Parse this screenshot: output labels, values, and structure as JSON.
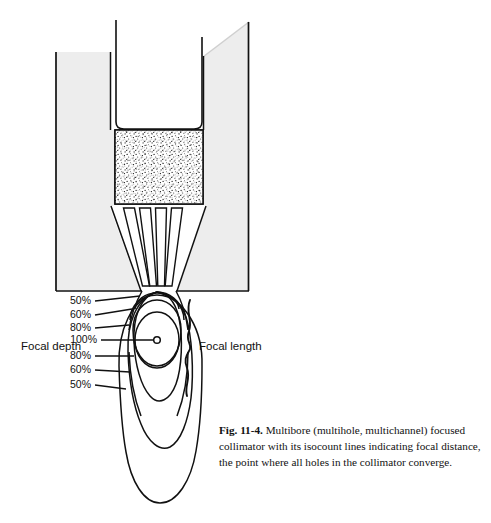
{
  "figure": {
    "number": "Fig. 11-4.",
    "caption_body": "Multibore (multihole, multichannel) focused collimator with its isocount lines indicating focal distance, the point where all holes in the collimator converge.",
    "colors": {
      "housing_fill": "#ededed",
      "outline": "#111111",
      "page_background": "#ffffff",
      "crystal_fill": "#ffffff",
      "text": "#111111"
    },
    "labels": {
      "focal_depth": "Focal depth",
      "focal_length": "Focal length"
    },
    "isocount_labels": [
      {
        "value": "50%",
        "position": "upper"
      },
      {
        "value": "60%",
        "position": "upper"
      },
      {
        "value": "80%",
        "position": "upper"
      },
      {
        "value": "100%",
        "position": "focal-point"
      },
      {
        "value": "80%",
        "position": "lower"
      },
      {
        "value": "60%",
        "position": "lower"
      },
      {
        "value": "50%",
        "position": "lower"
      }
    ],
    "parts": {
      "housing": "collimator-housing",
      "crystal": "scintillation-crystal",
      "bore_channels": "converging-bore-channels",
      "focal_point": "focal-point-marker",
      "isocount_field": "isocount-contour-field",
      "focal_length_brace": "focal-length-brace"
    }
  }
}
